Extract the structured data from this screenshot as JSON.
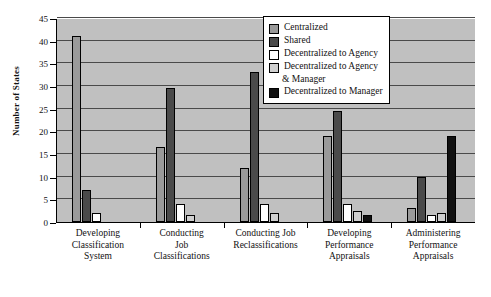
{
  "chart_data": {
    "type": "bar",
    "title": "",
    "xlabel": "",
    "ylabel": "Number of States",
    "ylim": [
      0,
      45
    ],
    "yticks": [
      0,
      5,
      10,
      15,
      20,
      25,
      30,
      35,
      40,
      45
    ],
    "grid": true,
    "legend_position": "top-right",
    "categories": [
      "Developing\nClassification\nSystem",
      "Conducting\nJob\nClassifications",
      "Conducting Job\nReclassifications",
      "Developing\nPerformance\nAppraisals",
      "Administering\nPerformance\nAppraisals"
    ],
    "series": [
      {
        "name": "Centralized",
        "color": "#9a9a9a",
        "values": [
          41,
          16.5,
          12,
          19,
          3
        ]
      },
      {
        "name": "Shared",
        "color": "#4a4a4a",
        "values": [
          7,
          29.5,
          33,
          24.5,
          10
        ]
      },
      {
        "name": "Decentralized to Agency",
        "color": "#ffffff",
        "values": [
          2,
          4,
          4,
          4,
          1.5
        ]
      },
      {
        "name": "Decentralized to Agency\n& Manager",
        "color": "#cfcfcf",
        "values": [
          0,
          1.5,
          2,
          2.5,
          2
        ]
      },
      {
        "name": "Decentralized to Manager",
        "color": "#111111",
        "values": [
          0,
          0,
          0,
          1.5,
          19
        ]
      }
    ]
  },
  "colors": {
    "plot_background": "#c0c0c0",
    "gridline": "#4a4a4a",
    "axis": "#000000",
    "page_background": "#ffffff"
  }
}
